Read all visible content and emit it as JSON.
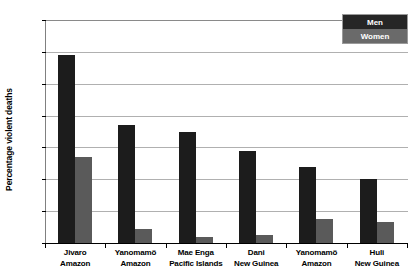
{
  "chart_data": {
    "type": "bar",
    "title": "",
    "xlabel": "",
    "ylabel": "Percentage violent deaths",
    "ylim": [
      0,
      70
    ],
    "yticks": [
      0,
      10,
      20,
      30,
      40,
      50,
      60,
      70
    ],
    "grid": true,
    "legend_position": "top-right",
    "categories": [
      "Jivaro Amazon",
      "Yanomamö Amazon",
      "Mae Enga Pacific Islands",
      "Dani New Guinea",
      "Yanomamö Amazon",
      "Huli New Guinea"
    ],
    "category_lines": [
      [
        "Jivaro",
        "Amazon"
      ],
      [
        "Yanomamö",
        "Amazon"
      ],
      [
        "Mae Enga",
        "Pacific Islands"
      ],
      [
        "Dani",
        "New Guinea"
      ],
      [
        "Yanomamö",
        "Amazon"
      ],
      [
        "Huli",
        "New Guinea"
      ]
    ],
    "series": [
      {
        "name": "Men",
        "color": "#1c1c1c",
        "values": [
          59,
          37,
          35,
          29,
          24,
          20
        ]
      },
      {
        "name": "Women",
        "color": "#5a5a5a",
        "values": [
          27,
          4.5,
          2,
          2.5,
          7.5,
          6.5
        ]
      }
    ]
  },
  "legend": {
    "items": [
      {
        "label": "Men",
        "color": "#262626"
      },
      {
        "label": "Women",
        "color": "#6a6a6a"
      }
    ]
  },
  "axis": {
    "y_title": "Percentage violent deaths",
    "y_tick_labels": [
      "70",
      "60",
      "50",
      "40",
      "30",
      "20",
      "10",
      "0"
    ]
  }
}
